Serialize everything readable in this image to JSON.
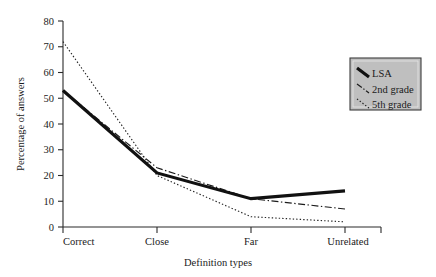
{
  "chart_data": {
    "type": "line",
    "title": "",
    "xlabel": "Definition types",
    "ylabel": "Percentage of answers",
    "categories": [
      "Correct",
      "Close",
      "Far",
      "Unrelated"
    ],
    "ylim": [
      0,
      80
    ],
    "yticks": [
      0,
      10,
      20,
      30,
      40,
      50,
      60,
      70,
      80
    ],
    "grid": false,
    "legend_position": "right",
    "series": [
      {
        "name": "LSA",
        "values": [
          53,
          21,
          11,
          14
        ],
        "style": "solid-thick",
        "color": "#111111"
      },
      {
        "name": "2nd grade",
        "values": [
          53,
          23,
          11,
          7
        ],
        "style": "dash-dot",
        "color": "#1b1b1b"
      },
      {
        "name": "5th grade",
        "values": [
          72,
          20,
          4,
          2
        ],
        "style": "dotted",
        "color": "#262626"
      }
    ]
  },
  "axes": {
    "y_tick_labels": [
      "0",
      "10",
      "20",
      "30",
      "40",
      "50",
      "60",
      "70",
      "80"
    ],
    "x_tick_labels": [
      "Correct",
      "Close",
      "Far",
      "Unrelated"
    ],
    "y_title": "Percentage of answers",
    "x_title": "Definition types"
  },
  "legend": {
    "entries": [
      {
        "label": "LSA"
      },
      {
        "label": "2nd grade"
      },
      {
        "label": "5th grade"
      }
    ]
  }
}
